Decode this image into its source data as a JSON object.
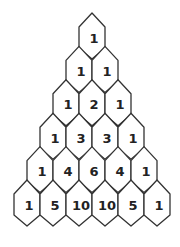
{
  "diagram": {
    "stroke_color": "#333333",
    "fill_color": "#ffffff",
    "text_color": "#222222",
    "rows": [
      [
        1
      ],
      [
        1,
        1
      ],
      [
        1,
        2,
        1
      ],
      [
        1,
        3,
        3,
        1
      ],
      [
        1,
        4,
        6,
        4,
        1
      ],
      [
        1,
        5,
        10,
        10,
        5,
        1
      ]
    ]
  }
}
